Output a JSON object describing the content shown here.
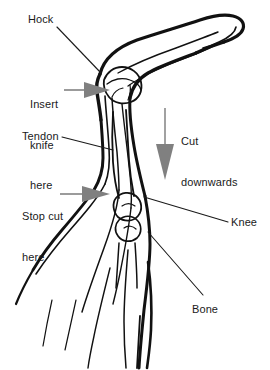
{
  "diagram": {
    "background_color": "#ffffff",
    "outline_color": "#111111",
    "arrow_color": "#808080",
    "leader_color": "#1a1a1a",
    "text_color": "#1a1a1a",
    "labels": [
      {
        "id": "hock",
        "text": "Hock",
        "lines": [
          "Hock"
        ]
      },
      {
        "id": "insert_knife",
        "text": "Insert knife here",
        "lines": [
          "Insert",
          "knife",
          "here"
        ]
      },
      {
        "id": "tendon",
        "text": "Tendon",
        "lines": [
          "Tendon"
        ]
      },
      {
        "id": "stop_cut",
        "text": "Stop cut here",
        "lines": [
          "Stop cut",
          "here"
        ]
      },
      {
        "id": "cut_downwards",
        "text": "Cut downwards",
        "lines": [
          "Cut",
          "downwards"
        ]
      },
      {
        "id": "knee",
        "text": "Knee",
        "lines": [
          "Knee"
        ]
      },
      {
        "id": "bone",
        "text": "Bone",
        "lines": [
          "Bone"
        ]
      }
    ],
    "label_text": {
      "hock": "Hock",
      "insert_line1": "Insert",
      "insert_line2": "knife",
      "insert_line3": "here",
      "tendon": "Tendon",
      "stopcut_line1": "Stop cut",
      "stopcut_line2": "here",
      "cutdown_line1": "Cut",
      "cutdown_line2": "downwards",
      "knee": "Knee",
      "bone": "Bone"
    },
    "annotations": {
      "action_arrows": [
        {
          "id": "insert-knife-arrow",
          "direction": "right",
          "style": "gray-solid-triangle"
        },
        {
          "id": "stop-cut-arrow",
          "direction": "right",
          "style": "gray-solid-triangle"
        },
        {
          "id": "cut-downwards-arrow",
          "direction": "down",
          "style": "gray-solid-triangle"
        }
      ],
      "leader_lines": [
        "hock",
        "insert_knife",
        "tendon",
        "stop_cut",
        "knee",
        "bone"
      ]
    }
  }
}
